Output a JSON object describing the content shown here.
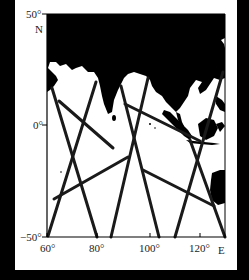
{
  "figure": {
    "title": "",
    "y_axis": {
      "ticks": [
        {
          "label": "50°",
          "value": 50,
          "y": 14
        },
        {
          "label": "0°",
          "value": 0,
          "y": 125
        },
        {
          "label": "−50°",
          "value": -50,
          "y": 237
        }
      ],
      "direction_label": "N"
    },
    "x_axis": {
      "ticks": [
        {
          "label": "60°",
          "value": 60,
          "x": 47
        },
        {
          "label": "80°",
          "value": 80,
          "x": 97
        },
        {
          "label": "100°",
          "value": 100,
          "x": 150
        },
        {
          "label": "120°",
          "value": 120,
          "x": 200
        }
      ],
      "direction_label": "E"
    },
    "extent": {
      "lon_min": 60,
      "lon_max": 129,
      "lat_min": -50,
      "lat_max": 50
    },
    "colors": {
      "land": "#000000",
      "ocean": "#ffffff",
      "track": "#1a1a1a",
      "frame": "#000000",
      "border": "#000000"
    },
    "tracks": [
      {
        "id": "t1",
        "x1": 52,
        "y1": 88,
        "x2": 97,
        "y2": 237
      },
      {
        "id": "t2",
        "x1": 96,
        "y1": 82,
        "x2": 48,
        "y2": 236
      },
      {
        "id": "t3",
        "x1": 59,
        "y1": 101,
        "x2": 113,
        "y2": 148
      },
      {
        "id": "t4",
        "x1": 54,
        "y1": 199,
        "x2": 128,
        "y2": 157
      },
      {
        "id": "t5",
        "x1": 148,
        "y1": 78,
        "x2": 111,
        "y2": 237
      },
      {
        "id": "t6",
        "x1": 121,
        "y1": 86,
        "x2": 159,
        "y2": 237
      },
      {
        "id": "t7",
        "x1": 125,
        "y1": 104,
        "x2": 200,
        "y2": 141
      },
      {
        "id": "t8",
        "x1": 143,
        "y1": 170,
        "x2": 214,
        "y2": 206
      },
      {
        "id": "t9",
        "x1": 223,
        "y1": 72,
        "x2": 175,
        "y2": 237
      },
      {
        "id": "t10",
        "x1": 190,
        "y1": 140,
        "x2": 225,
        "y2": 237
      }
    ]
  }
}
